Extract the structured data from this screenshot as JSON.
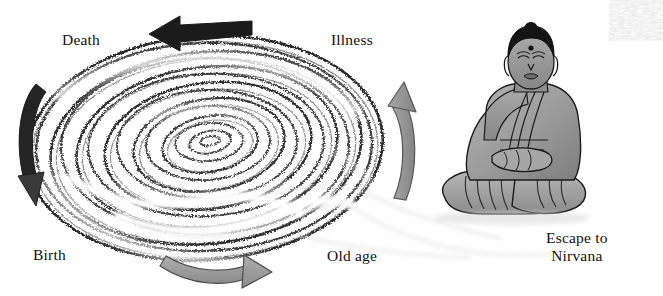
{
  "diagram": {
    "background_color": "#ffffff",
    "ink_color": "#111111",
    "grey_arrow_color": "#9a9a9a",
    "dark_arrow_color": "#1b1b1b",
    "figure_color": "#9c9c9c"
  },
  "labels": {
    "death": "Death",
    "illness": "Illness",
    "birth": "Birth",
    "old_age": "Old age",
    "escape_line1": "Escape to",
    "escape_line2": "Nirvana"
  },
  "arrows": [
    {
      "name": "top-arrow",
      "label": "Death to Illness",
      "direction": "left",
      "color": "#1b1b1b",
      "style": "straight-tapered"
    },
    {
      "name": "left-arrow",
      "label": "Death to Birth",
      "direction": "down",
      "color": "#2a2a2a",
      "style": "curved"
    },
    {
      "name": "bottom-arrow",
      "label": "Birth to Old age",
      "direction": "right",
      "color": "#9a9a9a",
      "style": "curved"
    },
    {
      "name": "right-arrow",
      "label": "Old age to Illness",
      "direction": "up",
      "color": "#8e8e8e",
      "style": "curved"
    }
  ],
  "figure": {
    "name": "seated-buddha",
    "pose": "lotus / meditation",
    "robe_color": "#9c9c9c",
    "hair_color": "#141414",
    "has_bindi": true
  },
  "trail": {
    "name": "escape-trail",
    "description": "white wispy stream leaving the spiral toward the seated figure",
    "color": "#e3e3e3"
  },
  "spiral": {
    "name": "samsara-spiral",
    "ring_count": 13,
    "style": "charcoal sketch concentric ellipses",
    "center_x": 205,
    "center_y": 145
  }
}
